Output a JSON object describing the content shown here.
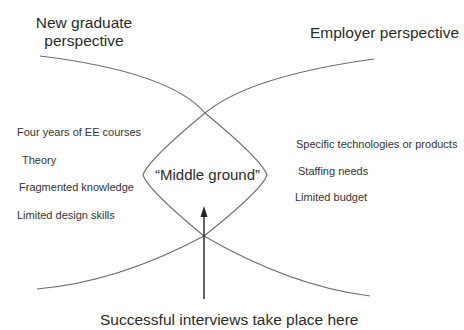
{
  "perspectives": {
    "graduate": {
      "title_line1": "New graduate",
      "title_line2": "perspective",
      "items": [
        "Four years of EE courses",
        "Theory",
        "Fragmented knowledge",
        "Limited design skills"
      ]
    },
    "employer": {
      "title": "Employer perspective",
      "items": [
        "Specific technologies or products",
        "Staffing needs",
        "Limited budget"
      ]
    }
  },
  "overlap": {
    "label": "“Middle ground”"
  },
  "arrow": {
    "caption": "Successful interviews take place here"
  },
  "colors": {
    "curve": "#6e6e6e",
    "arrow": "#222222",
    "text": "#2b2b2b",
    "background": "#ffffff"
  }
}
